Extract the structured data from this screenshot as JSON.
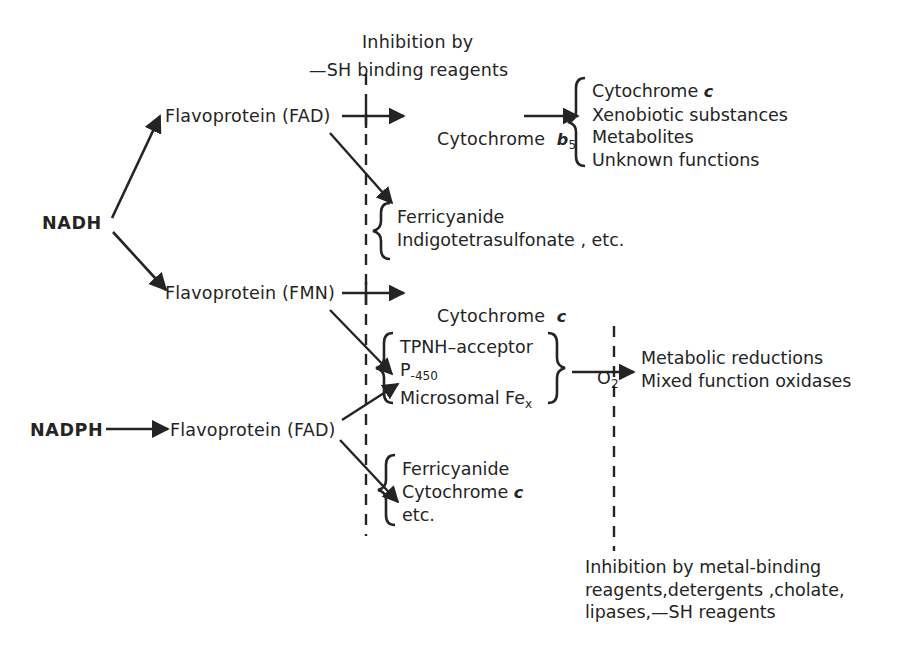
{
  "diagram": {
    "title_note": {
      "line1": "Inhibition by",
      "line2": "—SH binding reagents"
    },
    "donors": {
      "nadh": "NADH",
      "nadph": "NADPH"
    },
    "nodes": {
      "flavoprotein_fad_top": "Flavoprotein (FAD)",
      "flavoprotein_fmn": "Flavoprotein (FMN)",
      "flavoprotein_fad_bottom": "Flavoprotein (FAD)",
      "cytochrome_b5_name": "Cytochrome",
      "cytochrome_b5_italic": "b",
      "cytochrome_b5_sub": "5",
      "cytochrome_c_name": "Cytochrome",
      "cytochrome_c_italic": "c"
    },
    "groups": {
      "b5_acceptors": [
        {
          "text": "Cytochrome ",
          "italic": "c"
        },
        {
          "text": "Xenobiotic substances",
          "italic": ""
        },
        {
          "text": "Metabolites",
          "italic": ""
        },
        {
          "text": "Unknown functions",
          "italic": ""
        }
      ],
      "fad_top_acceptors": [
        {
          "text": "Ferricyanide",
          "italic": ""
        },
        {
          "text": "Indigotetrasulfonate , etc.",
          "italic": ""
        }
      ],
      "p450_system": [
        {
          "text": "TPNH–acceptor",
          "italic": ""
        },
        {
          "text": "P",
          "sub": "-450",
          "italic": ""
        },
        {
          "text": "Microsomal Fe",
          "sub": "x",
          "italic": ""
        }
      ],
      "fad_bottom_acceptors": [
        {
          "text": "Ferricyanide",
          "italic": ""
        },
        {
          "text": "Cytochrome ",
          "italic": "c"
        },
        {
          "text": "etc.",
          "italic": ""
        }
      ]
    },
    "oxygen_label": "O",
    "oxygen_sub": "2",
    "outcomes": [
      "Metabolic reductions",
      "Mixed function oxidases"
    ],
    "bottom_note": [
      "Inhibition by metal-binding",
      "reagents,detergents ,cholate,",
      "lipases,—SH reagents"
    ],
    "colors": {
      "ink": "#242424",
      "background": "#ffffff"
    }
  }
}
